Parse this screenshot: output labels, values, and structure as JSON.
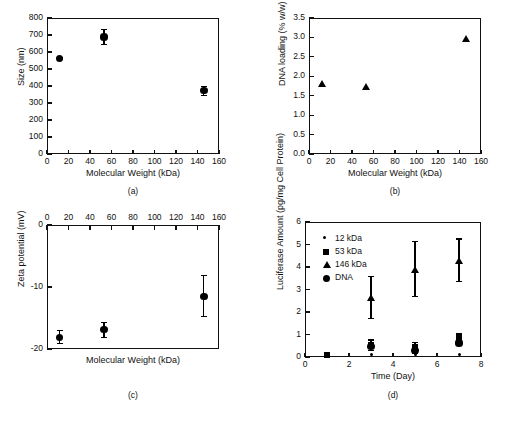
{
  "figure": {
    "panels": [
      "a",
      "b",
      "c",
      "d"
    ]
  },
  "chart_data": [
    {
      "id": "a",
      "caption": "(a)",
      "type": "scatter",
      "title": "",
      "xlabel": "Molecular Weight (kDa)",
      "ylabel": "Size (nm)",
      "xlim": [
        0,
        160
      ],
      "ylim": [
        0,
        800
      ],
      "xticks": [
        0,
        20,
        40,
        60,
        80,
        100,
        120,
        140,
        160
      ],
      "yticks": [
        0,
        100,
        200,
        300,
        400,
        500,
        600,
        700,
        800
      ],
      "xtick_labels": [
        "0",
        "20",
        "40",
        "60",
        "80",
        "100",
        "120",
        "140",
        "160"
      ],
      "ytick_labels": [
        "0",
        "100",
        "200",
        "300",
        "400",
        "500",
        "600",
        "700",
        "800"
      ],
      "grid": false,
      "legend": null,
      "x_axis_position": "bottom",
      "series": [
        {
          "name": "Size",
          "marker": "circle",
          "x": [
            12,
            53,
            146
          ],
          "y": [
            563,
            688,
            372
          ],
          "yerr": [
            10,
            45,
            28
          ]
        }
      ]
    },
    {
      "id": "b",
      "caption": "(b)",
      "type": "scatter",
      "title": "",
      "xlabel": "Molecular Weight (kDa)",
      "ylabel": "DNA loading (% w/w)",
      "xlim": [
        0,
        160
      ],
      "ylim": [
        0.0,
        3.5
      ],
      "xticks": [
        0,
        20,
        40,
        60,
        80,
        100,
        120,
        140,
        160
      ],
      "yticks": [
        0.0,
        0.5,
        1.0,
        1.5,
        2.0,
        2.5,
        3.0,
        3.5
      ],
      "xtick_labels": [
        "0",
        "20",
        "40",
        "60",
        "80",
        "100",
        "120",
        "140",
        "160"
      ],
      "ytick_labels": [
        "0.0",
        "0.5",
        "1.0",
        "1.5",
        "2.0",
        "2.5",
        "3.0",
        "3.5"
      ],
      "grid": false,
      "legend": null,
      "x_axis_position": "bottom",
      "series": [
        {
          "name": "DNA loading",
          "marker": "triangle",
          "x": [
            12,
            53,
            146
          ],
          "y": [
            1.81,
            1.72,
            2.97
          ],
          "yerr": [
            0,
            0,
            0
          ]
        }
      ]
    },
    {
      "id": "c",
      "caption": "(c)",
      "type": "scatter",
      "title": "",
      "xlabel": "Molecular Weight (kDa)",
      "ylabel": "Zeta potential (mV)",
      "xlim": [
        0,
        160
      ],
      "ylim": [
        -20,
        0
      ],
      "xticks": [
        0,
        20,
        40,
        60,
        80,
        100,
        120,
        140,
        160
      ],
      "yticks": [
        -20,
        -10,
        0
      ],
      "xtick_labels": [
        "0",
        "20",
        "40",
        "60",
        "80",
        "100",
        "120",
        "140",
        "160"
      ],
      "ytick_labels": [
        "-20",
        "-10",
        "0"
      ],
      "grid": false,
      "legend": null,
      "x_axis_position": "top",
      "series": [
        {
          "name": "Zeta potential",
          "marker": "circle",
          "x": [
            12,
            53,
            146
          ],
          "y": [
            -18.1,
            -16.9,
            -11.5
          ],
          "yerr": [
            1.1,
            1.3,
            3.4
          ]
        }
      ]
    },
    {
      "id": "d",
      "caption": "(d)",
      "type": "scatter",
      "title": "",
      "xlabel": "Time (Day)",
      "ylabel": "Luciferase Amount (pg/mg Cell Protein)",
      "xlim": [
        0,
        8
      ],
      "ylim": [
        0,
        6
      ],
      "xticks": [
        0,
        2,
        4,
        6,
        8
      ],
      "yticks": [
        0,
        1,
        2,
        3,
        4,
        5,
        6
      ],
      "xtick_labels": [
        "0",
        "2",
        "4",
        "6",
        "8"
      ],
      "ytick_labels": [
        "0",
        "1",
        "2",
        "3",
        "4",
        "5",
        "6"
      ],
      "grid": false,
      "x_axis_position": "bottom",
      "legend": {
        "position": "top-left",
        "entries": [
          {
            "label": "12 kDa",
            "marker": "star"
          },
          {
            "label": "53 kDa",
            "marker": "square"
          },
          {
            "label": "146 kDa",
            "marker": "triangle"
          },
          {
            "label": "DNA",
            "marker": "circle"
          }
        ]
      },
      "series": [
        {
          "name": "12 kDa",
          "marker": "star",
          "x": [
            1,
            3,
            5,
            7
          ],
          "y": [
            0.08,
            0.12,
            0.1,
            0.1
          ],
          "yerr": [
            0,
            0,
            0,
            0
          ]
        },
        {
          "name": "53 kDa",
          "marker": "square",
          "x": [
            1,
            3,
            5,
            7
          ],
          "y": [
            0.1,
            0.52,
            0.45,
            0.9
          ],
          "yerr": [
            0,
            0.26,
            0.22,
            0.18
          ]
        },
        {
          "name": "146 kDa",
          "marker": "triangle",
          "x": [
            3,
            5,
            7
          ],
          "y": [
            2.65,
            3.9,
            4.3
          ],
          "yerr": [
            0.95,
            1.25,
            0.97
          ]
        },
        {
          "name": "DNA",
          "marker": "circle",
          "x": [
            3,
            5,
            7
          ],
          "y": [
            0.45,
            0.3,
            0.62
          ],
          "yerr": [
            0.2,
            0.15,
            0.12
          ]
        }
      ]
    }
  ]
}
